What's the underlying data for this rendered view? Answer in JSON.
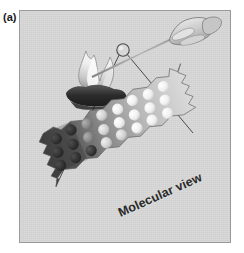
{
  "figure": {
    "panel_label": "(a)",
    "caption": "Molecular view",
    "background_color": "#d6d6d6",
    "border_color": "#9a9a9a",
    "page_background": "#ffffff"
  },
  "scene": {
    "hand_label": "hand-holding-wire",
    "wire_label": "metal-wire-probe",
    "bead_label": "sample-bead",
    "flame_label": "burner-flame",
    "burner_label": "burner-base",
    "zoom_lines_label": "magnification-leader-lines"
  },
  "molecular_strip": {
    "rotation_degrees": -24,
    "torn_edges": true,
    "gradient_from": "#4a4a4a",
    "gradient_to": "#d8d8d8",
    "rows": 3,
    "columns": 8,
    "particles": [
      [
        "#3a3a3a",
        "#3d3d3d",
        "#565656",
        "#8e8e8e",
        "#c9c9c9",
        "#efefef",
        "#fbfbfb",
        "#ffffff"
      ],
      [
        "#343434",
        "#3a3a3a",
        "#4e4e4e",
        "#8a8a8a",
        "#c6c6c6",
        "#ececec",
        "#fafafa",
        "#ffffff"
      ],
      [
        "#303030",
        "#373737",
        "#4a4a4a",
        "#858585",
        "#c2c2c2",
        "#e8e8e8",
        "#f8f8f8",
        "#ffffff"
      ]
    ]
  },
  "colors": {
    "flame_core": "#f2f2f2",
    "flame_mid": "#b9b9b9",
    "flame_outline": "#6f6f6f",
    "burner_dark": "#2e2e2e",
    "line_stroke": "#3f3f3f",
    "caption_color": "#2a2a2a"
  }
}
